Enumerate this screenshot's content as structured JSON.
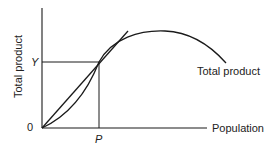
{
  "diagram": {
    "y_axis_label": "Total product",
    "x_axis_label": "Population",
    "origin_label": "0",
    "y_tick_label": "Y",
    "x_tick_label": "P",
    "curve_label": "Total product",
    "colors": {
      "line": "#1a1a1a",
      "background": "#ffffff"
    }
  }
}
